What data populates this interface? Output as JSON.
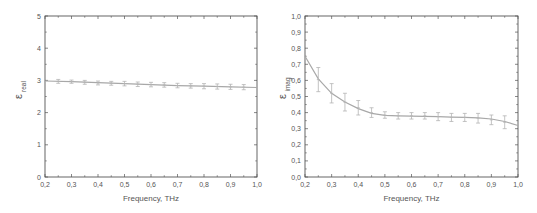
{
  "chart_data": [
    {
      "type": "line",
      "title": "",
      "xlabel": "Frequency, THz",
      "ylabel": "ε_real",
      "ylabel_main": "ε",
      "ylabel_sub": "real",
      "xlim": [
        0.2,
        1.0
      ],
      "ylim": [
        0,
        5
      ],
      "grid": false,
      "legend": null,
      "x_ticks": [
        "0,2",
        "0,3",
        "0,4",
        "0,5",
        "0,6",
        "0,7",
        "0,8",
        "0,9",
        "1,0"
      ],
      "y_ticks": [
        "0",
        "1",
        "2",
        "3",
        "4",
        "5"
      ],
      "series": [
        {
          "name": "measured",
          "x": [
            0.25,
            0.3,
            0.35,
            0.4,
            0.45,
            0.5,
            0.55,
            0.6,
            0.65,
            0.7,
            0.75,
            0.8,
            0.85,
            0.9,
            0.95
          ],
          "values": [
            2.97,
            2.96,
            2.94,
            2.92,
            2.91,
            2.9,
            2.88,
            2.87,
            2.86,
            2.84,
            2.83,
            2.82,
            2.81,
            2.8,
            2.79
          ],
          "errors": [
            0.06,
            0.05,
            0.06,
            0.06,
            0.06,
            0.07,
            0.07,
            0.07,
            0.07,
            0.07,
            0.07,
            0.08,
            0.08,
            0.08,
            0.08
          ]
        },
        {
          "name": "fit",
          "x": [
            0.2,
            0.3,
            0.4,
            0.5,
            0.6,
            0.7,
            0.8,
            0.9,
            1.0
          ],
          "values": [
            2.98,
            2.96,
            2.93,
            2.9,
            2.87,
            2.84,
            2.82,
            2.8,
            2.78
          ]
        }
      ]
    },
    {
      "type": "line",
      "title": "",
      "xlabel": "Frequency, THz",
      "ylabel": "ε_imag",
      "ylabel_main": "ε",
      "ylabel_sub": "imag",
      "xlim": [
        0.2,
        1.0
      ],
      "ylim": [
        0,
        1.0
      ],
      "grid": false,
      "legend": null,
      "x_ticks": [
        "0,2",
        "0,3",
        "0,4",
        "0,5",
        "0,6",
        "0,7",
        "0,8",
        "0,9",
        "1,0"
      ],
      "y_ticks": [
        "0,0",
        "0,1",
        "0,2",
        "0,3",
        "0,4",
        "0,5",
        "0,6",
        "0,7",
        "0,8",
        "0,9",
        "1,0"
      ],
      "series": [
        {
          "name": "measured",
          "x": [
            0.25,
            0.3,
            0.35,
            0.4,
            0.45,
            0.5,
            0.55,
            0.6,
            0.65,
            0.7,
            0.75,
            0.8,
            0.85,
            0.9,
            0.95
          ],
          "values": [
            0.605,
            0.52,
            0.465,
            0.43,
            0.4,
            0.385,
            0.38,
            0.38,
            0.38,
            0.375,
            0.37,
            0.37,
            0.365,
            0.355,
            0.34
          ],
          "errors": [
            0.075,
            0.06,
            0.055,
            0.045,
            0.03,
            0.02,
            0.02,
            0.02,
            0.02,
            0.025,
            0.025,
            0.025,
            0.03,
            0.03,
            0.04
          ]
        },
        {
          "name": "fit",
          "x": [
            0.2,
            0.25,
            0.3,
            0.35,
            0.4,
            0.45,
            0.5,
            0.55,
            0.6,
            0.65,
            0.7,
            0.75,
            0.8,
            0.85,
            0.9,
            0.95,
            1.0
          ],
          "values": [
            0.75,
            0.61,
            0.52,
            0.465,
            0.425,
            0.395,
            0.383,
            0.38,
            0.378,
            0.377,
            0.375,
            0.372,
            0.37,
            0.368,
            0.36,
            0.345,
            0.32
          ]
        }
      ]
    }
  ],
  "colors": {
    "axis": "#555555",
    "curve": "#a8a8a8",
    "errorbar": "#b4b4b4",
    "text": "#555555"
  }
}
